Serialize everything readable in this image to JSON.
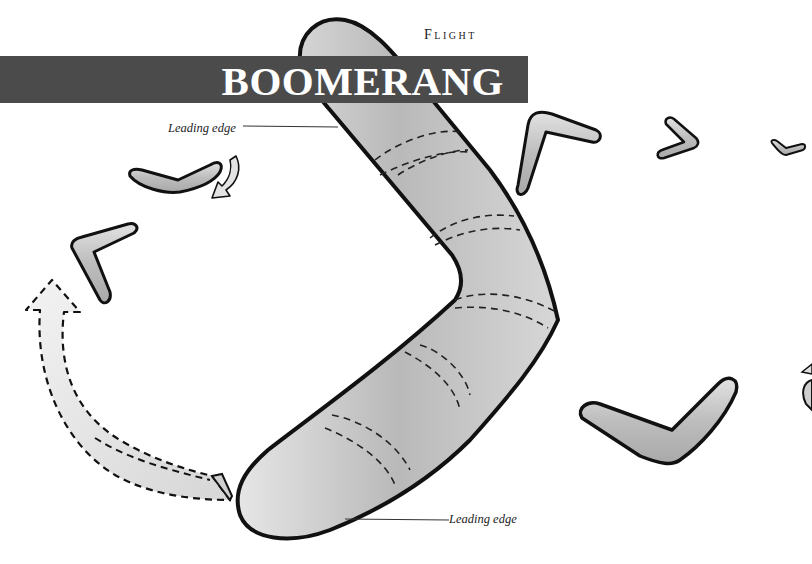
{
  "header": {
    "section": "Flight",
    "title": "BOOMERANG"
  },
  "callouts": [
    {
      "label": "Leading edge",
      "position": "top-left"
    },
    {
      "label": "Leading edge",
      "position": "bottom-right"
    }
  ],
  "illustration": {
    "subject": "boomerang flight path",
    "elements": [
      "main-boomerang-with-dashed-cross-sections",
      "dashed-return-path-arrow",
      "curved-rotation-arrow",
      "small-boomerangs-in-flight-sequence"
    ]
  },
  "colors": {
    "banner": "#4b4b4b",
    "banner_text": "#ffffff",
    "boomerang_fill": "#c8c8c8",
    "outline": "#111111"
  }
}
